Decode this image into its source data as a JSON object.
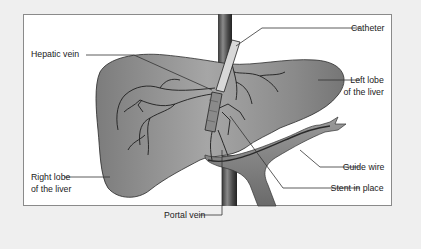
{
  "diagram": {
    "labels": {
      "hepatic_vein": "Hepatic vein",
      "catheter": "Catheter",
      "left_lobe_line1": "Left lobe",
      "left_lobe_line2": "of the liver",
      "right_lobe_line1": "Right lobe",
      "right_lobe_line2": "of the liver",
      "guide_wire": "Guide wire",
      "stent": "Stent in place",
      "portal_vein": "Portal vein"
    },
    "colors": {
      "background": "#efefef",
      "panel": "#ffffff",
      "liver": "#8e8e8e",
      "vessel_dark": "#4a4a4a",
      "outline": "#1e1e1e"
    }
  }
}
